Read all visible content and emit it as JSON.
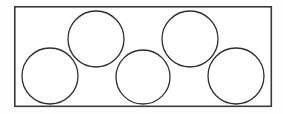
{
  "figure": {
    "name": "circles-packed-in-rectangle",
    "canvas": {
      "width": 283,
      "height": 114,
      "background_color": "#fefefe"
    },
    "colors": {
      "rectangle_stroke": "#3b3b3b",
      "rectangle_fill": "#ffffff",
      "circle_stroke": "#2e2e2e",
      "circle_fill": "none"
    },
    "rectangle": {
      "label": "container-rectangle",
      "x": 14.8,
      "y": 6.8,
      "width": 256.5,
      "height": 99.5,
      "stroke_width": 1.6
    },
    "circle_count": 5,
    "circle_radius": 28,
    "circle_stroke_width": 1.3,
    "circles": [
      {
        "label": "circle-top-left",
        "row": "top",
        "index": 1,
        "cx": 96,
        "cy": 39,
        "r": 28
      },
      {
        "label": "circle-top-right",
        "row": "top",
        "index": 2,
        "cx": 190,
        "cy": 39,
        "r": 28
      },
      {
        "label": "circle-bottom-left",
        "row": "bottom",
        "index": 3,
        "cx": 50,
        "cy": 76,
        "r": 28
      },
      {
        "label": "circle-bottom-center",
        "row": "bottom",
        "index": 4,
        "cx": 143,
        "cy": 77,
        "r": 27
      },
      {
        "label": "circle-bottom-right",
        "row": "bottom",
        "index": 5,
        "cx": 236,
        "cy": 76,
        "r": 28
      }
    ]
  }
}
